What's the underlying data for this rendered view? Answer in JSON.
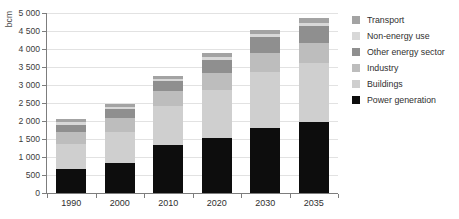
{
  "chart_data": {
    "type": "bar",
    "stacked": true,
    "title": "",
    "xlabel": "",
    "ylabel": "bcm",
    "categories": [
      "1990",
      "2000",
      "2010",
      "2020",
      "2030",
      "2035"
    ],
    "ylim": [
      0,
      5000
    ],
    "ytick_labels": [
      "5 000",
      "4 500",
      "4 000",
      "3 500",
      "3 000",
      "2 500",
      "2 000",
      "1 500",
      "1 000",
      "500",
      "0"
    ],
    "ytick_values": [
      5000,
      4500,
      4000,
      3500,
      3000,
      2500,
      2000,
      1500,
      1000,
      500,
      0
    ],
    "grid": true,
    "legend_position": "right",
    "series": [
      {
        "name": "Power generation",
        "color": "#0d0d0d",
        "values": [
          660,
          830,
          1320,
          1540,
          1800,
          1960
        ]
      },
      {
        "name": "Buildings",
        "color": "#cfcfcf",
        "values": [
          700,
          870,
          1110,
          1330,
          1560,
          1660
        ]
      },
      {
        "name": "Industry",
        "color": "#bdbdbd",
        "values": [
          330,
          380,
          400,
          470,
          530,
          560
        ]
      },
      {
        "name": "Other energy sector",
        "color": "#8f8f8f",
        "values": [
          210,
          250,
          290,
          350,
          440,
          450
        ]
      },
      {
        "name": "Non-energy use",
        "color": "#d8d8d8",
        "values": [
          80,
          60,
          60,
          80,
          90,
          100
        ]
      },
      {
        "name": "Transport",
        "color": "#a3a3a3",
        "values": [
          90,
          80,
          80,
          110,
          110,
          140
        ]
      }
    ],
    "totals": [
      2070,
      2470,
      3260,
      3880,
      4530,
      4870
    ]
  },
  "legend": {
    "items": [
      {
        "label": "Transport",
        "color": "#a3a3a3"
      },
      {
        "label": "Non-energy use",
        "color": "#d8d8d8"
      },
      {
        "label": "Other energy sector",
        "color": "#8f8f8f"
      },
      {
        "label": "Industry",
        "color": "#bdbdbd"
      },
      {
        "label": "Buildings",
        "color": "#cfcfcf"
      },
      {
        "label": "Power generation",
        "color": "#0d0d0d"
      }
    ]
  }
}
